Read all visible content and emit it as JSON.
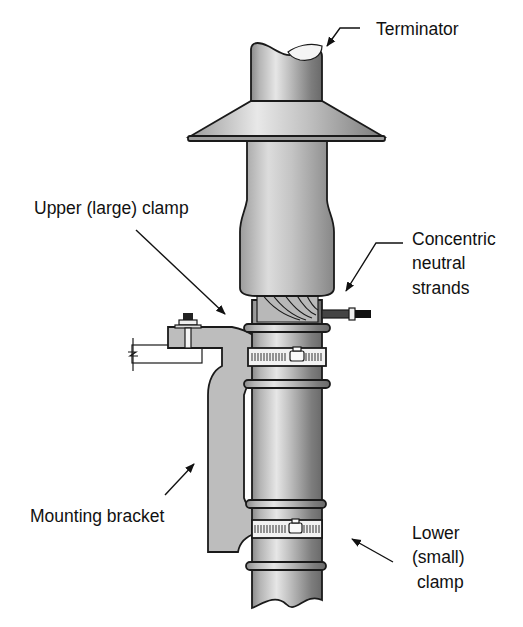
{
  "diagram": {
    "background": "#ffffff",
    "colors": {
      "metal_light": "#d9d9d9",
      "metal_mid": "#a8a8a8",
      "metal_dark": "#6e6e6e",
      "bracket": "#bdbdbd",
      "outline": "#1a1a1a",
      "band": "#f2f2f2"
    },
    "labels": {
      "terminator": "Terminator",
      "upper_clamp": "Upper (large) clamp",
      "concentric_line1": "Concentric",
      "concentric_line2": "neutral",
      "concentric_line3": "strands",
      "mounting_bracket": "Mounting bracket",
      "lower_line1": "Lower",
      "lower_line2": "(small)",
      "lower_line3": "clamp"
    },
    "components": [
      {
        "name": "terminator",
        "label_ref": "terminator"
      },
      {
        "name": "upper-clamp",
        "label_ref": "upper_clamp"
      },
      {
        "name": "concentric-neutral-strands",
        "label_ref": "concentric_line1"
      },
      {
        "name": "mounting-bracket",
        "label_ref": "mounting_bracket"
      },
      {
        "name": "lower-clamp",
        "label_ref": "lower_line1"
      }
    ]
  }
}
